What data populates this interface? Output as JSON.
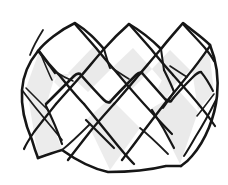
{
  "figure": {
    "title": "Woven band",
    "medium": "pen-and-ink line drawing",
    "subject_type": "geometric weaving diagram",
    "canvas": {
      "width": 228,
      "height": 185,
      "background_color": "#ffffff"
    },
    "palette": {
      "ink": "#161616",
      "ink_light": "#1c1c1c",
      "facet_shaded": "#ebebeb",
      "facet_shaded_alt": "#e6e6e6",
      "facet_light": "#f2f2f2",
      "facet_white": "#ffffff",
      "background": "#ffffff"
    },
    "stroke": {
      "heavy_width": 2.6,
      "medium_width": 2.0,
      "light_width": 1.3
    },
    "structure": {
      "weave_type": "plain over-under diagonal plait",
      "strip_families": 2,
      "top_peaks": 3,
      "top_valleys": 2,
      "bottom_points": 3,
      "visible_facet_count": 22
    },
    "key_vertices": {
      "top_peak_left": [
        75,
        23
      ],
      "top_peak_middle": [
        128,
        24
      ],
      "top_peak_right": [
        182,
        23
      ],
      "left_shoulder": [
        38,
        50
      ],
      "right_shoulder": [
        210,
        44
      ],
      "bottom_point_left": [
        38,
        158
      ],
      "bottom_point_middle": [
        108,
        172
      ],
      "bottom_point_right": [
        181,
        166
      ]
    },
    "shaded_facets": [
      {
        "name": "upper-left-shade",
        "centroid": [
          58,
          70
        ]
      },
      {
        "name": "upper-mid-shade",
        "centroid": [
          110,
          66
        ]
      },
      {
        "name": "upper-right-shade",
        "centroid": [
          160,
          70
        ]
      },
      {
        "name": "lower-left-shade",
        "centroid": [
          55,
          125
        ]
      },
      {
        "name": "lower-mid-shade",
        "centroid": [
          115,
          140
        ]
      },
      {
        "name": "lower-right-shade",
        "centroid": [
          175,
          128
        ]
      },
      {
        "name": "right-edge-shade",
        "centroid": [
          198,
          95
        ]
      },
      {
        "name": "left-edge-shade",
        "centroid": [
          30,
          105
        ]
      }
    ]
  }
}
